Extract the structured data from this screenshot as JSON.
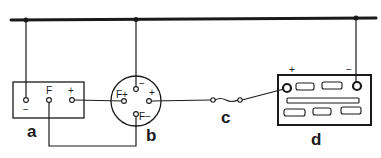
{
  "diagram": {
    "type": "wiring-diagram",
    "stroke_color": "#1a1a1a",
    "background": "#ffffff",
    "components": [
      {
        "id": "a",
        "label": "a",
        "description": "regulator box",
        "terminals": [
          "−",
          "F",
          "+"
        ]
      },
      {
        "id": "b",
        "label": "b",
        "description": "round dynamo / generator",
        "terminals": [
          "−",
          "+",
          "F+",
          "F−"
        ]
      },
      {
        "id": "c",
        "label": "c",
        "description": "fuse"
      },
      {
        "id": "d",
        "label": "d",
        "description": "battery",
        "terminals": [
          "+",
          "−"
        ]
      }
    ],
    "labels": {
      "a": "a",
      "b": "b",
      "c": "c",
      "d": "d",
      "a_minus": "−",
      "a_f": "F",
      "a_plus": "+",
      "b_minus": "−",
      "b_plus": "+",
      "b_fplus": "F+",
      "b_fminus": "F−",
      "d_plus": "+",
      "d_minus": "−"
    }
  }
}
